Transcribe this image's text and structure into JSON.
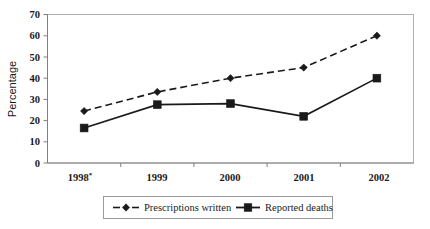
{
  "chart_data": {
    "type": "line",
    "title": "",
    "xlabel": "",
    "ylabel": "Percentage",
    "ylim": [
      0,
      70
    ],
    "ytick_step": 10,
    "yticks": [
      "0",
      "10",
      "20",
      "30",
      "40",
      "50",
      "60",
      "70"
    ],
    "categories": [
      "1998",
      "1999",
      "2000",
      "2001",
      "2002"
    ],
    "category_labels": [
      "1998*",
      "1999",
      "2000",
      "2001",
      "2002"
    ],
    "category_footnote_marker": "*",
    "grid": false,
    "legend_position": "bottom",
    "series": [
      {
        "name": "Prescriptions written",
        "values": [
          24.5,
          33.5,
          40,
          45,
          60
        ],
        "line_style": "dashed",
        "marker": "diamond",
        "color": "#1a1a1a"
      },
      {
        "name": "Reported deaths",
        "values": [
          16.5,
          27.5,
          28,
          22,
          40
        ],
        "line_style": "solid",
        "marker": "square",
        "color": "#1a1a1a"
      }
    ]
  },
  "legend": {
    "entries": [
      {
        "label": "Prescriptions written",
        "marker": "diamond-icon",
        "style": "dashed"
      },
      {
        "label": "Reported deaths",
        "marker": "square-icon",
        "style": "solid"
      }
    ]
  },
  "colors": {
    "series": "#1a1a1a",
    "axis": "#808080",
    "frame": "#b0b0b0",
    "background": "#ffffff",
    "text": "#1a1a1a"
  }
}
